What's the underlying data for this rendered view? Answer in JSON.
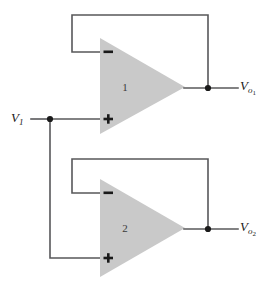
{
  "diagram": {
    "background_color": "#ffffff",
    "wire_color": "#58585a",
    "opamp_fill_color": "#c9c9c9",
    "node_color": "#1a1a1a"
  },
  "input": {
    "label_main": "V",
    "label_sub": "1",
    "node_label": "input-node"
  },
  "opamp1": {
    "number": "1",
    "inverting_sign": "−",
    "noninverting_sign": "+",
    "output": {
      "label_main": "V",
      "label_sub": "o",
      "label_subsub": "1"
    }
  },
  "opamp2": {
    "number": "2",
    "inverting_sign": "−",
    "noninverting_sign": "+",
    "output": {
      "label_main": "V",
      "label_sub": "o",
      "label_subsub": "2"
    }
  }
}
